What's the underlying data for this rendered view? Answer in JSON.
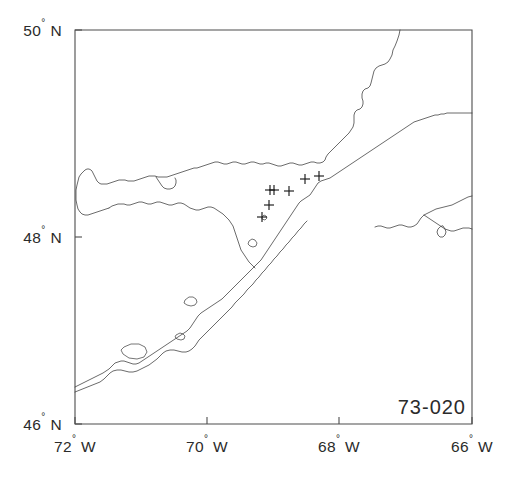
{
  "figure": {
    "kind": "station-location-map",
    "region_name": "Gulf of St. Lawrence / St. Lawrence Estuary",
    "cruise_label": "73-020",
    "frame": {
      "left": 75,
      "top": 30,
      "right": 472,
      "bottom": 424
    },
    "colors": {
      "background": "#ffffff",
      "axis": "#4d4d4d",
      "coastline": "#3a3a3a",
      "marker": "#1a1a1a",
      "text": "#2b2b2b"
    }
  },
  "axes": {
    "x": {
      "label_suffix": "W",
      "degree_symbol": "°",
      "min": -72,
      "max": -66,
      "ticks": [
        {
          "value": -72,
          "number": "72",
          "deg": "°",
          "hem": "W",
          "px": 75
        },
        {
          "value": -70,
          "number": "70",
          "deg": "°",
          "hem": "W",
          "px": 207
        },
        {
          "value": -68,
          "number": "68",
          "deg": "°",
          "hem": "W",
          "px": 339
        },
        {
          "value": -66,
          "number": "66",
          "deg": "°",
          "hem": "W",
          "px": 472
        }
      ]
    },
    "y": {
      "label_suffix": "N",
      "degree_symbol": "°",
      "min": 46,
      "max": 50,
      "ticks": [
        {
          "value": 50,
          "number": "50",
          "deg": "°",
          "hem": "N",
          "px": 30
        },
        {
          "value": 48,
          "number": "48",
          "deg": "°",
          "hem": "N",
          "px": 237
        },
        {
          "value": 46,
          "number": "46",
          "deg": "°",
          "hem": "N",
          "px": 424
        }
      ]
    }
  },
  "chart_data": {
    "type": "scatter",
    "title": "73-020",
    "xlabel": "Longitude",
    "ylabel": "Latitude",
    "xlim": [
      -72,
      -66
    ],
    "ylim": [
      46,
      50
    ],
    "grid": false,
    "legend": null,
    "marker": "plus",
    "series": [
      {
        "name": "stations",
        "points": [
          {
            "lon": -68.72,
            "lat": 48.5,
            "px": 270,
            "py": 190
          },
          {
            "lon": -68.65,
            "lat": 48.5,
            "px": 274,
            "py": 190
          },
          {
            "lon": -68.42,
            "lat": 48.49,
            "px": 289,
            "py": 191
          },
          {
            "lon": -68.12,
            "lat": 48.63,
            "px": 305,
            "py": 179
          },
          {
            "lon": -67.92,
            "lat": 48.66,
            "px": 319,
            "py": 176
          },
          {
            "lon": -68.74,
            "lat": 48.34,
            "px": 269,
            "py": 205
          },
          {
            "lon": -68.85,
            "lat": 48.22,
            "px": 262,
            "py": 217
          }
        ]
      }
    ]
  },
  "annotations": [
    {
      "name": "cruise-id",
      "text": "73-020",
      "px": 466,
      "py": 414,
      "anchor": "end"
    }
  ],
  "features": {
    "north_shore_label": "North Shore coastline",
    "south_shore_label": "Gaspe Peninsula coastline",
    "estuary_label": "St. Lawrence Estuary",
    "islands_count": 4
  }
}
